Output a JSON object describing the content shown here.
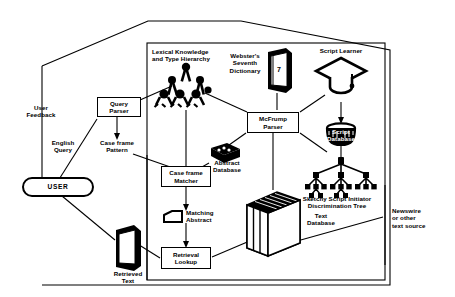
{
  "diagram": {
    "stroke_color": "#000000",
    "background_color": "#ffffff",
    "nodes": [
      {
        "id": "user",
        "label": "USER",
        "shape": "stadium"
      },
      {
        "id": "query_parser",
        "label": "Query\nParser",
        "shape": "box"
      },
      {
        "id": "case_frame_matcher",
        "label": "Case frame\nMatcher",
        "shape": "box"
      },
      {
        "id": "retrieval_lookup",
        "label": "Retrieval\nLookup",
        "shape": "box"
      },
      {
        "id": "mcfrump_parser",
        "label": "McFrump\nParser",
        "shape": "box"
      }
    ],
    "labels": [
      {
        "id": "user_feedback",
        "label": "User\nFeedback"
      },
      {
        "id": "english_query",
        "label": "English\nQuery"
      },
      {
        "id": "case_frame_pattern",
        "label": "Case frame\nPattern"
      },
      {
        "id": "lexical_knowledge",
        "label": "Lexical Knowledge\nand Type Hierarchy"
      },
      {
        "id": "websters_dictionary",
        "label": "Webster's\nSeventh\nDictionary"
      },
      {
        "id": "script_learner",
        "label": "Script Learner"
      },
      {
        "id": "script_database",
        "label": "Script\nDatabase"
      },
      {
        "id": "abstract_database",
        "label": "Abstract\nDatabase"
      },
      {
        "id": "matching_abstract",
        "label": "Matching\nAbstract"
      },
      {
        "id": "sketchy_script",
        "label": "Sketchy Script Initiator\nDiscrimination Tree"
      },
      {
        "id": "text_database",
        "label": "Text\nDatabase"
      },
      {
        "id": "newswire",
        "label": "Newswire\nor other\ntext source"
      },
      {
        "id": "retrieved_text",
        "label": "Retrieved\nText"
      },
      {
        "id": "dictionary_volume_number",
        "label": "7"
      }
    ],
    "icons": [
      {
        "id": "lexical-hierarchy-icon",
        "name": "network-tree-icon"
      },
      {
        "id": "dictionary-icon",
        "name": "book-icon"
      },
      {
        "id": "script-learner-icon",
        "name": "graduation-cap-icon"
      },
      {
        "id": "script-database-icon",
        "name": "database-cylinder-icon"
      },
      {
        "id": "abstract-database-icon",
        "name": "card-stack-icon"
      },
      {
        "id": "matching-abstract-icon",
        "name": "document-card-icon"
      },
      {
        "id": "discrimination-tree-icon",
        "name": "tree-graph-icon"
      },
      {
        "id": "text-database-icon",
        "name": "file-block-stack-icon"
      },
      {
        "id": "retrieved-text-icon",
        "name": "book-icon"
      }
    ]
  }
}
